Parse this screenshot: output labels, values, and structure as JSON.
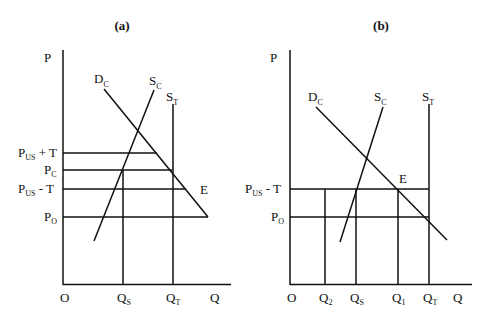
{
  "panels": [
    {
      "id": "a",
      "title": "(a)",
      "axes": {
        "y_label": "P",
        "x_label": "Q",
        "origin": "O"
      },
      "curves": {
        "demand": {
          "main": "D",
          "sub": "C"
        },
        "supply_c": {
          "main": "S",
          "sub": "C"
        },
        "supply_t": {
          "main": "S",
          "sub": "T"
        }
      },
      "price_labels": [
        {
          "main": "P",
          "sub": "US",
          "suffix": " + T"
        },
        {
          "main": "P",
          "sub": "C",
          "suffix": ""
        },
        {
          "main": "P",
          "sub": "US",
          "suffix": " - T"
        },
        {
          "main": "P",
          "sub": "O",
          "suffix": ""
        }
      ],
      "quantity_labels": [
        {
          "main": "Q",
          "sub": "S"
        },
        {
          "main": "Q",
          "sub": "T"
        }
      ],
      "point_label": "E"
    },
    {
      "id": "b",
      "title": "(b)",
      "axes": {
        "y_label": "P",
        "x_label": "Q",
        "origin": "O"
      },
      "curves": {
        "demand": {
          "main": "D",
          "sub": "C"
        },
        "supply_c": {
          "main": "S",
          "sub": "C"
        },
        "supply_t": {
          "main": "S",
          "sub": "T"
        }
      },
      "price_labels": [
        {
          "main": "P",
          "sub": "US",
          "suffix": " - T"
        },
        {
          "main": "P",
          "sub": "O",
          "suffix": ""
        }
      ],
      "quantity_labels": [
        {
          "main": "Q",
          "sub": "2"
        },
        {
          "main": "Q",
          "sub": "S"
        },
        {
          "main": "Q",
          "sub": "1"
        },
        {
          "main": "Q",
          "sub": "T"
        }
      ],
      "point_label": "E"
    }
  ]
}
